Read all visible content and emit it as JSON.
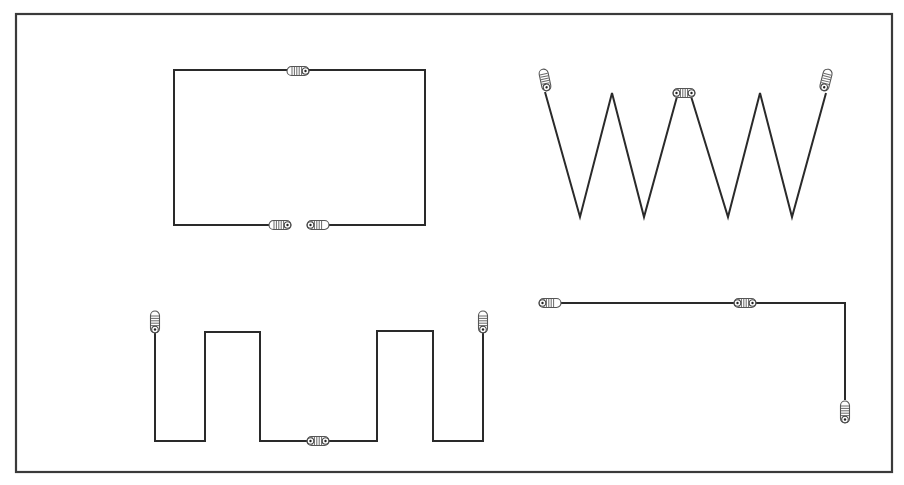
{
  "diagram": {
    "title": "",
    "colors": {
      "wire": "#2a2a2a",
      "frame": "#3a3a3a",
      "background": "#ffffff",
      "connector": "#555555"
    },
    "frame": {
      "x": 16,
      "y": 14,
      "width": 876,
      "height": 458
    },
    "shapes": [
      {
        "name": "rectangle-loop",
        "type": "polyline",
        "points": [
          [
            280,
            225
          ],
          [
            174,
            225
          ],
          [
            174,
            70
          ],
          [
            425,
            70
          ],
          [
            425,
            225
          ],
          [
            318,
            225
          ]
        ],
        "connectors": [
          {
            "x": 298,
            "y": 71,
            "orientation": "horizontal",
            "eye": "right"
          },
          {
            "x": 280,
            "y": 225,
            "orientation": "horizontal",
            "eye": "right"
          },
          {
            "x": 318,
            "y": 225,
            "orientation": "horizontal",
            "eye": "left"
          }
        ]
      },
      {
        "name": "zigzag-wave",
        "type": "polyline",
        "points": [
          [
            545,
            92
          ],
          [
            580,
            217
          ],
          [
            612,
            93
          ],
          [
            644,
            217
          ],
          [
            678,
            93
          ]
        ],
        "points_b": [
          [
            690,
            93
          ],
          [
            728,
            217
          ],
          [
            760,
            93
          ],
          [
            792,
            217
          ],
          [
            826,
            93
          ]
        ],
        "connectors": [
          {
            "x": 545,
            "y": 80,
            "orientation": "vertical",
            "eye": "bottom",
            "rotate": -12
          },
          {
            "x": 684,
            "y": 93,
            "orientation": "horizontal",
            "eye": "both"
          },
          {
            "x": 826,
            "y": 80,
            "orientation": "vertical",
            "eye": "bottom",
            "rotate": 14
          }
        ]
      },
      {
        "name": "square-wave",
        "type": "polyline",
        "points": [
          [
            155,
            333
          ],
          [
            155,
            441
          ],
          [
            205,
            441
          ],
          [
            205,
            332
          ],
          [
            260,
            332
          ],
          [
            260,
            441
          ],
          [
            318,
            441
          ],
          [
            377,
            441
          ],
          [
            377,
            331
          ],
          [
            433,
            331
          ],
          [
            433,
            441
          ],
          [
            483,
            441
          ],
          [
            483,
            333
          ]
        ],
        "connectors": [
          {
            "x": 155,
            "y": 322,
            "orientation": "vertical",
            "eye": "bottom"
          },
          {
            "x": 318,
            "y": 441,
            "orientation": "horizontal",
            "eye": "both"
          },
          {
            "x": 483,
            "y": 322,
            "orientation": "vertical",
            "eye": "bottom"
          }
        ]
      },
      {
        "name": "l-shape",
        "type": "polyline",
        "points": [
          [
            552,
            303
          ],
          [
            845,
            303
          ],
          [
            845,
            400
          ]
        ],
        "connectors": [
          {
            "x": 550,
            "y": 303,
            "orientation": "horizontal",
            "eye": "left"
          },
          {
            "x": 745,
            "y": 303,
            "orientation": "horizontal",
            "eye": "both"
          },
          {
            "x": 845,
            "y": 412,
            "orientation": "vertical",
            "eye": "bottom"
          }
        ]
      }
    ]
  }
}
